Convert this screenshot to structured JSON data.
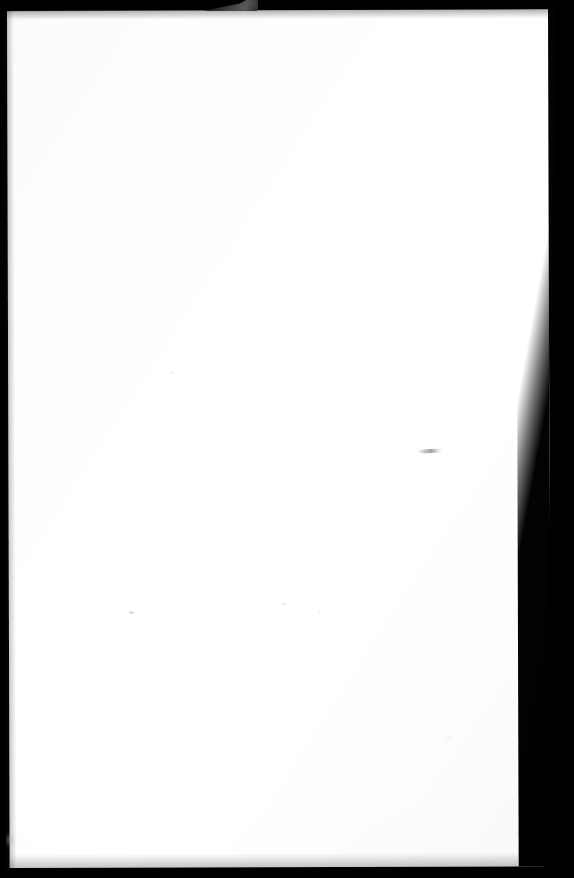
{
  "document": {
    "kind": "scanned-page",
    "page_content_text": "",
    "visible_text": "",
    "orientation": "portrait",
    "page_state": "blank"
  },
  "scan": {
    "width_px": 574,
    "height_px": 878,
    "background_color": "#000000",
    "paper_color": "#ffffff",
    "paper_tint_color": "#f7f7f7"
  },
  "borders": {
    "top_band_px": 12,
    "left_band_px": 7,
    "right_band_px": 26,
    "bottom_band_px": 12,
    "border_color": "#000000"
  },
  "paper": {
    "left_px": 7,
    "top_px": 11,
    "width_px": 541,
    "height_px": 857,
    "skew_degrees": -0.18
  },
  "artifacts": [
    {
      "name": "fold-wedge",
      "description": "grey triangular fold at top centre",
      "x_px": 203,
      "y_px": 0,
      "width_px": 54,
      "height_px": 11,
      "color": "#555555"
    },
    {
      "name": "smudge-streak",
      "description": "faint horizontal pencil streak",
      "x_px": 417,
      "y_px": 449,
      "width_px": 26,
      "height_px": 4,
      "color": "#8c8c8c"
    },
    {
      "name": "speck-a",
      "description": "small light speck",
      "x_px": 129,
      "y_px": 611,
      "width_px": 5,
      "height_px": 3,
      "color": "#cdcdcd"
    },
    {
      "name": "speck-b",
      "description": "small light speck",
      "x_px": 282,
      "y_px": 603,
      "width_px": 4,
      "height_px": 2,
      "color": "#d7d7d7"
    },
    {
      "name": "speck-c",
      "description": "small light speck",
      "x_px": 170,
      "y_px": 371,
      "width_px": 3,
      "height_px": 3,
      "color": "#e1e1e1"
    },
    {
      "name": "speck-d",
      "description": "small light speck",
      "x_px": 318,
      "y_px": 610,
      "width_px": 3,
      "height_px": 2,
      "color": "#e4e4e4"
    },
    {
      "name": "smudge-bottom-left",
      "description": "grey smudge near lower-left paper edge",
      "x_px": 2,
      "y_px": 832,
      "width_px": 14,
      "height_px": 16,
      "color": "#aaaaaa"
    },
    {
      "name": "smudge-mid-right",
      "description": "very faint smudge lower-right",
      "x_px": 444,
      "y_px": 735,
      "width_px": 10,
      "height_px": 6,
      "color": "#e1e1e1"
    }
  ]
}
